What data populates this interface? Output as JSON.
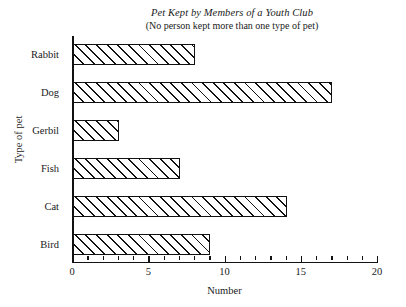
{
  "chart_data": {
    "type": "bar",
    "orientation": "horizontal",
    "title": "Pet Kept by Members of a Youth Club",
    "subtitle": "(No person kept more than one type of pet)",
    "xlabel": "Number",
    "ylabel": "Type of pet",
    "categories": [
      "Rabbit",
      "Dog",
      "Gerbil",
      "Fish",
      "Cat",
      "Bird"
    ],
    "values": [
      8,
      17,
      3,
      7,
      14,
      9
    ],
    "xlim": [
      0,
      20
    ],
    "xticks": [
      0,
      5,
      10,
      15,
      20
    ],
    "xtick_labels": [
      "0",
      "5",
      "10",
      "15",
      "20"
    ],
    "x_minor_tick_interval": 1,
    "grid": false,
    "legend": false,
    "bar_fill": "#ffffff",
    "bar_edge_color": "#111111",
    "bar_hatch": "diagonal-forward-slash",
    "background": "#ffffff"
  }
}
